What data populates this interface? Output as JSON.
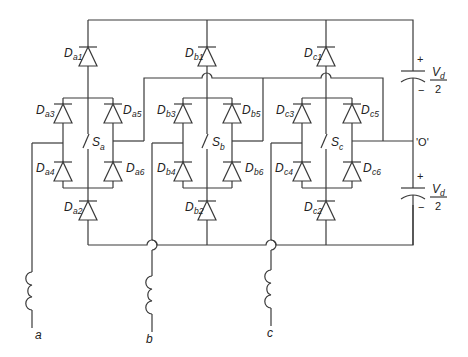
{
  "diagram": {
    "type": "circuit-schematic",
    "phases": [
      {
        "id": "a",
        "terminal_label": "a",
        "switch": {
          "main": "S",
          "sub": "a"
        },
        "diodes": [
          {
            "pos": "top",
            "main": "D",
            "sub": "a1"
          },
          {
            "pos": "bottom",
            "main": "D",
            "sub": "a2"
          },
          {
            "pos": "upper-left",
            "main": "D",
            "sub": "a3"
          },
          {
            "pos": "lower-left",
            "main": "D",
            "sub": "a4"
          },
          {
            "pos": "upper-right",
            "main": "D",
            "sub": "a5"
          },
          {
            "pos": "lower-right",
            "main": "D",
            "sub": "a6"
          }
        ]
      },
      {
        "id": "b",
        "terminal_label": "b",
        "switch": {
          "main": "S",
          "sub": "b"
        },
        "diodes": [
          {
            "pos": "top",
            "main": "D",
            "sub": "b1"
          },
          {
            "pos": "bottom",
            "main": "D",
            "sub": "b2"
          },
          {
            "pos": "upper-left",
            "main": "D",
            "sub": "b3"
          },
          {
            "pos": "lower-left",
            "main": "D",
            "sub": "b4"
          },
          {
            "pos": "upper-right",
            "main": "D",
            "sub": "b5"
          },
          {
            "pos": "lower-right",
            "main": "D",
            "sub": "b6"
          }
        ]
      },
      {
        "id": "c",
        "terminal_label": "c",
        "switch": {
          "main": "S",
          "sub": "c"
        },
        "diodes": [
          {
            "pos": "top",
            "main": "D",
            "sub": "c1"
          },
          {
            "pos": "bottom",
            "main": "D",
            "sub": "c2"
          },
          {
            "pos": "upper-left",
            "main": "D",
            "sub": "c3"
          },
          {
            "pos": "lower-left",
            "main": "D",
            "sub": "c4"
          },
          {
            "pos": "upper-right",
            "main": "D",
            "sub": "c5"
          },
          {
            "pos": "lower-right",
            "main": "D",
            "sub": "c6"
          }
        ]
      }
    ],
    "capacitors": [
      {
        "id": "upper",
        "plus": "+",
        "minus": "−",
        "num_main": "V",
        "num_sub": "d",
        "den": "2"
      },
      {
        "id": "lower",
        "plus": "+",
        "minus": "−",
        "num_main": "V",
        "num_sub": "d",
        "den": "2"
      }
    ],
    "neutral_label": "'O'"
  }
}
